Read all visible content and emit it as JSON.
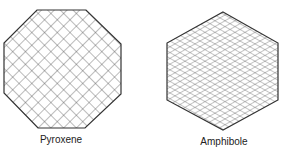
{
  "diagram": {
    "figures": [
      {
        "name": "pyroxene",
        "label": "Pyroxene",
        "shape": "octagon",
        "cleavage_pattern": "two cleavages at ~90 degrees (diagonal square grid)",
        "points": "37,10 86,10 121,44 121,94 85,128 38,128 4,93 4,43",
        "label_x": 61,
        "label_y": 134
      },
      {
        "name": "amphibole",
        "label": "Amphibole",
        "shape": "hexagon",
        "cleavage_pattern": "two cleavages at ~60/120 degrees (rhombic grid)",
        "points": "223,12 278,43 278,100 223,130 167,100 167,43",
        "label_x": 224,
        "label_y": 136
      }
    ],
    "colors": {
      "outline": "#333333",
      "hatch": "#555555",
      "background": "#ffffff",
      "text": "#222222"
    }
  }
}
